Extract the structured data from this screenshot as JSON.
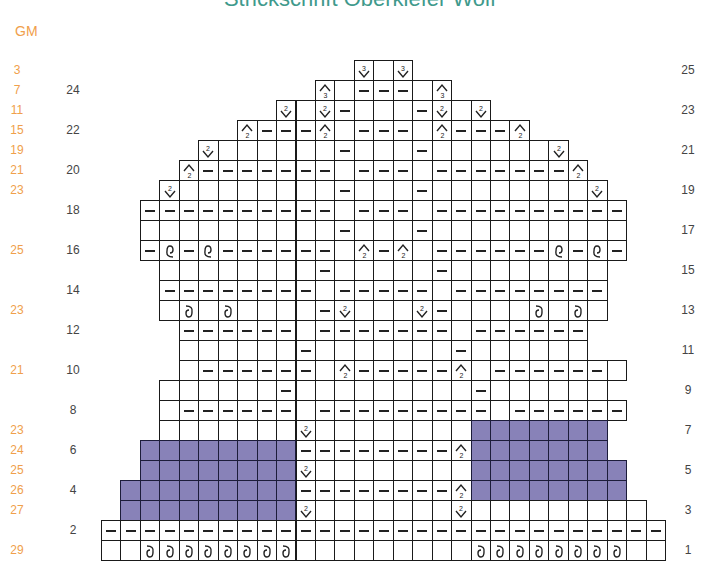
{
  "title": "Strickschrift Oberkiefer Wolf",
  "gm_header": "GM",
  "colors": {
    "title": "#3f9a8c",
    "gm": "#f0a04b",
    "shaded": "#8882b8",
    "grid": "#1a1a1a"
  },
  "legend_codes": {
    ".": "empty-stitch",
    "-": "purl-stitch",
    "P": "no-stitch-shaded",
    "v": "decrease-2-down",
    "V": "decrease-3-down",
    "a": "increase-2-up",
    "A": "increase-3-up",
    "d": "twisted-stitch",
    "u": "twisted-stitch-mirrored"
  },
  "rows": [
    {
      "row": 25,
      "gm": "3",
      "start": 13,
      "cells": "V.V"
    },
    {
      "row": 24,
      "gm": "7",
      "start": 11,
      "cells": "A.---.A"
    },
    {
      "row": 23,
      "gm": "11",
      "start": 9,
      "cells": "v.v-...-v.v"
    },
    {
      "row": 22,
      "gm": "15",
      "start": 7,
      "cells": "a---a.---.a---a"
    },
    {
      "row": 21,
      "gm": "19",
      "start": 5,
      "cells": "v......-...-......v"
    },
    {
      "row": 20,
      "gm": "21",
      "start": 4,
      "cells": "a-------.---.-------a"
    },
    {
      "row": 19,
      "gm": "23",
      "start": 3,
      "cells": "v........-...-........v"
    },
    {
      "row": 18,
      "gm": "",
      "start": 2,
      "cells": "----------.---.----------"
    },
    {
      "row": 17,
      "gm": "",
      "start": 2,
      "cells": "..........-...-.........."
    },
    {
      "row": 16,
      "gm": "25",
      "start": 2,
      "cells": "-u-u------.a-a.------u-u-"
    },
    {
      "row": 15,
      "gm": "",
      "start": 3,
      "cells": "........-.....-........"
    },
    {
      "row": 14,
      "gm": "",
      "start": 3,
      "cells": "--------.-----.--------"
    },
    {
      "row": 13,
      "gm": "23",
      "start": 3,
      "cells": ".d.d....-v...v-....d.d."
    },
    {
      "row": 12,
      "gm": "",
      "start": 4,
      "cells": "------.-------.------"
    },
    {
      "row": 11,
      "gm": "",
      "start": 4,
      "cells": "......-.......-......"
    },
    {
      "row": 10,
      "gm": "21",
      "start": 4,
      "cells": ".------.a-----a.------."
    },
    {
      "row": 9,
      "gm": "",
      "start": 3,
      "cells": "......-.........-......"
    },
    {
      "row": 8,
      "gm": "",
      "start": 3,
      "cells": ".------.---------.------"
    },
    {
      "row": 7,
      "gm": "23",
      "start": 3,
      "cells": ".......v........PPPPPPP"
    },
    {
      "row": 6,
      "gm": "24",
      "start": 2,
      "cells": "PPPPPPPP--------aPPPPPPP"
    },
    {
      "row": 5,
      "gm": "25",
      "start": 2,
      "cells": "PPPPPPPPv........PPPPPPPP"
    },
    {
      "row": 4,
      "gm": "26",
      "start": 1,
      "cells": "PPPPPPPPP--------aPPPPPPPP"
    },
    {
      "row": 3,
      "gm": "27",
      "start": 1,
      "cells": "PPPPPPPPPv.......v.........",
      "note": ""
    },
    {
      "row": 2,
      "gm": "",
      "start": 0,
      "cells": "-----------------------------"
    },
    {
      "row": 1,
      "gm": "29",
      "start": 0,
      "cells": "..dddddddd.........dddddddd.."
    }
  ],
  "left_row_labels": [
    "24",
    "22",
    "20",
    "18",
    "16",
    "14",
    "12",
    "10",
    "8",
    "6",
    "4",
    "2"
  ],
  "right_row_labels": [
    "25",
    "23",
    "21",
    "19",
    "17",
    "15",
    "13",
    "11",
    "9",
    "7",
    "5",
    "3",
    "1"
  ]
}
